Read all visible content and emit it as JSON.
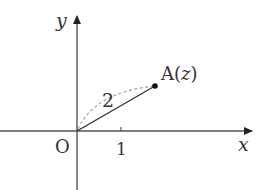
{
  "diagram": {
    "axes": {
      "x_label": "x",
      "y_label": "y",
      "origin_label": "O",
      "tick_label": "1"
    },
    "point": {
      "name": "A",
      "open_paren": "(",
      "variable": "z",
      "close_paren": ")"
    },
    "segment_length_label": "2",
    "colors": {
      "axis": "#555555",
      "segment": "#333333",
      "arc": "#999999",
      "text": "#333333"
    }
  }
}
